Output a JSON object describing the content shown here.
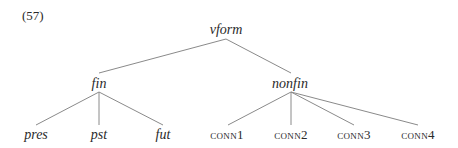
{
  "example_number": "(57)",
  "tree": {
    "root": {
      "label": "vform",
      "x": 226,
      "y": 23,
      "style": "italic"
    },
    "level1": [
      {
        "label": "fin",
        "x": 99,
        "y": 77,
        "style": "italic"
      },
      {
        "label": "nonfin",
        "x": 290,
        "y": 77,
        "style": "italic"
      }
    ],
    "leaves": [
      {
        "label": "pres",
        "x": 36,
        "y": 128,
        "style": "italic",
        "parent": "fin"
      },
      {
        "label": "pst",
        "x": 99,
        "y": 128,
        "style": "italic",
        "parent": "fin"
      },
      {
        "label": "fut",
        "x": 163,
        "y": 128,
        "style": "italic",
        "parent": "fin"
      },
      {
        "label": "conn1",
        "x": 227,
        "y": 128,
        "style": "smallcaps",
        "parent": "nonfin"
      },
      {
        "label": "conn2",
        "x": 291,
        "y": 128,
        "style": "smallcaps",
        "parent": "nonfin"
      },
      {
        "label": "conn3",
        "x": 354,
        "y": 128,
        "style": "smallcaps",
        "parent": "nonfin"
      },
      {
        "label": "conn4",
        "x": 418,
        "y": 128,
        "style": "smallcaps",
        "parent": "nonfin"
      }
    ],
    "edges": [
      {
        "from": "vform",
        "to": "fin",
        "x1": 226,
        "y1": 39,
        "x2": 99,
        "y2": 73
      },
      {
        "from": "vform",
        "to": "nonfin",
        "x1": 226,
        "y1": 39,
        "x2": 291,
        "y2": 73
      },
      {
        "from": "fin",
        "to": "pres",
        "x1": 99,
        "y1": 92,
        "x2": 36,
        "y2": 125
      },
      {
        "from": "fin",
        "to": "pst",
        "x1": 99,
        "y1": 92,
        "x2": 99,
        "y2": 125
      },
      {
        "from": "fin",
        "to": "fut",
        "x1": 99,
        "y1": 92,
        "x2": 163,
        "y2": 125
      },
      {
        "from": "nonfin",
        "to": "conn1",
        "x1": 291,
        "y1": 92,
        "x2": 228,
        "y2": 125
      },
      {
        "from": "nonfin",
        "to": "conn2",
        "x1": 291,
        "y1": 92,
        "x2": 291,
        "y2": 125
      },
      {
        "from": "nonfin",
        "to": "conn3",
        "x1": 291,
        "y1": 92,
        "x2": 354,
        "y2": 125
      },
      {
        "from": "nonfin",
        "to": "conn4",
        "x1": 291,
        "y1": 92,
        "x2": 418,
        "y2": 125
      }
    ]
  },
  "colors": {
    "line": "#8a8a8a",
    "text": "#2a2a2a"
  }
}
